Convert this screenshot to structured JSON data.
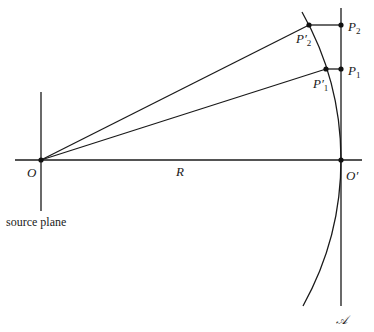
{
  "figure": {
    "labels": {
      "origin": "O",
      "image_point": "O′",
      "radius": "R",
      "source_plane": "source plane",
      "p1": "P",
      "p1_sub": "1",
      "p1_prime": "P′",
      "p1_prime_sub": "1",
      "p2": "P",
      "p2_sub": "2",
      "p2_prime": "P′",
      "p2_prime_sub": "2",
      "axis_plane": "𝒜"
    },
    "colors": {
      "line": "#1a1a1a",
      "background": "#ffffff"
    }
  }
}
